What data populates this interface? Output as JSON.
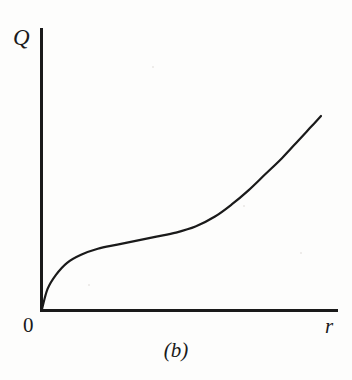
{
  "figure": {
    "caption": "(b)",
    "origin_label": "0",
    "background_color": "#fdfdfc",
    "ink_color": "#1a1a1a"
  },
  "chart_data": {
    "type": "line",
    "title": "",
    "subtitle": "",
    "caption": "(b)",
    "xlabel": "r",
    "ylabel": "Q",
    "origin_label": "0",
    "xlim": [
      0,
      1
    ],
    "ylim": [
      0,
      1
    ],
    "grid": false,
    "legend": null,
    "tick_labels": {
      "x": [
        "0"
      ],
      "y": []
    },
    "annotations": [],
    "axis_style": {
      "x_axis": "solid-line-with-no-ticks",
      "y_axis": "solid-line-with-no-ticks",
      "arrowheads": false
    },
    "series": [
      {
        "name": "Q(r)",
        "color": "#1a1a1a",
        "line_width": 2.2,
        "x": [
          0.0,
          0.02,
          0.05,
          0.09,
          0.14,
          0.2,
          0.27,
          0.34,
          0.41,
          0.48,
          0.55,
          0.62,
          0.68,
          0.74,
          0.8,
          0.86,
          0.92,
          0.96,
          1.0
        ],
        "y": [
          0.0,
          0.1,
          0.17,
          0.23,
          0.27,
          0.3,
          0.32,
          0.34,
          0.36,
          0.38,
          0.41,
          0.46,
          0.52,
          0.59,
          0.67,
          0.75,
          0.84,
          0.9,
          0.96
        ]
      }
    ]
  }
}
